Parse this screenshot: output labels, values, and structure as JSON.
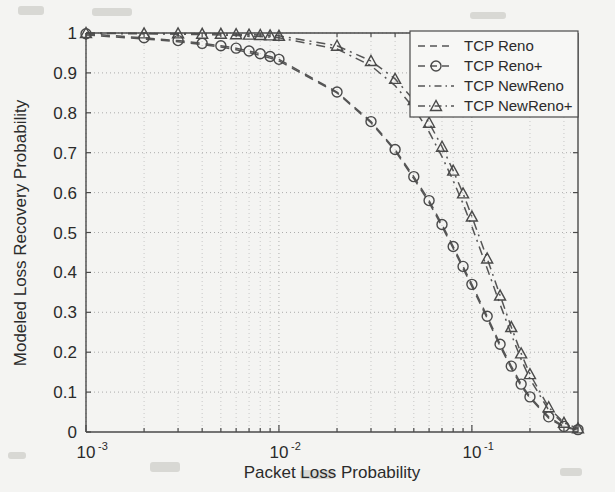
{
  "chart_data": {
    "type": "line",
    "title": "",
    "xlabel": "Packet Loss Probability",
    "ylabel": "Modeled Loss Recovery Probability",
    "xscale": "log",
    "yscale": "linear",
    "xlim": [
      0.001,
      0.3548
    ],
    "ylim": [
      0,
      1
    ],
    "grid": true,
    "legend_position": "top-right",
    "x_tick_labels": [
      "10^-3",
      "10^-2",
      "10^-1"
    ],
    "x_tick_values": [
      0.001,
      0.01,
      0.1
    ],
    "y_tick_labels": [
      "0",
      "0.1",
      "0.2",
      "0.3",
      "0.4",
      "0.5",
      "0.6",
      "0.7",
      "0.8",
      "0.9",
      "1"
    ],
    "y_tick_values": [
      0,
      0.1,
      0.2,
      0.3,
      0.4,
      0.5,
      0.6,
      0.7,
      0.8,
      0.9,
      1.0
    ],
    "series": [
      {
        "name": "TCP Reno",
        "linestyle": "dashed",
        "marker": "none",
        "color": "#555555",
        "x": [
          0.001,
          0.002,
          0.003,
          0.004,
          0.005,
          0.006,
          0.007,
          0.008,
          0.009,
          0.01,
          0.02,
          0.03,
          0.04,
          0.05,
          0.06,
          0.07,
          0.08,
          0.09,
          0.1,
          0.12,
          0.14,
          0.16,
          0.18,
          0.2,
          0.25,
          0.3,
          0.3548
        ],
        "y": [
          0.995,
          0.985,
          0.978,
          0.971,
          0.965,
          0.958,
          0.951,
          0.944,
          0.937,
          0.93,
          0.85,
          0.775,
          0.705,
          0.635,
          0.575,
          0.515,
          0.46,
          0.41,
          0.365,
          0.285,
          0.215,
          0.16,
          0.115,
          0.085,
          0.035,
          0.012,
          0.005
        ]
      },
      {
        "name": "TCP Reno+",
        "linestyle": "dashed",
        "marker": "circle",
        "color": "#555555",
        "x": [
          0.001,
          0.002,
          0.003,
          0.004,
          0.005,
          0.006,
          0.007,
          0.008,
          0.009,
          0.01,
          0.02,
          0.03,
          0.04,
          0.05,
          0.06,
          0.07,
          0.08,
          0.09,
          0.1,
          0.12,
          0.14,
          0.16,
          0.18,
          0.2,
          0.25,
          0.3,
          0.3548
        ],
        "y": [
          0.998,
          0.988,
          0.981,
          0.974,
          0.968,
          0.962,
          0.955,
          0.948,
          0.941,
          0.934,
          0.852,
          0.778,
          0.708,
          0.64,
          0.58,
          0.52,
          0.465,
          0.415,
          0.37,
          0.29,
          0.22,
          0.165,
          0.12,
          0.088,
          0.038,
          0.014,
          0.006
        ]
      },
      {
        "name": "TCP NewReno",
        "linestyle": "dashdot",
        "marker": "none",
        "color": "#555555",
        "x": [
          0.001,
          0.002,
          0.003,
          0.004,
          0.005,
          0.006,
          0.007,
          0.008,
          0.009,
          0.01,
          0.02,
          0.03,
          0.04,
          0.05,
          0.06,
          0.07,
          0.08,
          0.09,
          0.1,
          0.12,
          0.14,
          0.16,
          0.18,
          0.2,
          0.25,
          0.3,
          0.3548
        ],
        "y": [
          0.999,
          0.998,
          0.997,
          0.996,
          0.995,
          0.994,
          0.992,
          0.991,
          0.99,
          0.988,
          0.96,
          0.918,
          0.868,
          0.812,
          0.752,
          0.69,
          0.63,
          0.572,
          0.515,
          0.41,
          0.32,
          0.245,
          0.182,
          0.133,
          0.055,
          0.02,
          0.008
        ]
      },
      {
        "name": "TCP NewReno+",
        "linestyle": "dashdot",
        "marker": "triangle",
        "color": "#555555",
        "x": [
          0.001,
          0.002,
          0.003,
          0.004,
          0.005,
          0.006,
          0.007,
          0.008,
          0.009,
          0.01,
          0.02,
          0.03,
          0.04,
          0.05,
          0.06,
          0.07,
          0.08,
          0.09,
          0.1,
          0.12,
          0.14,
          0.16,
          0.18,
          0.2,
          0.25,
          0.3,
          0.3548
        ],
        "y": [
          1.0,
          0.999,
          0.999,
          0.998,
          0.998,
          0.997,
          0.996,
          0.995,
          0.994,
          0.993,
          0.968,
          0.93,
          0.885,
          0.832,
          0.775,
          0.715,
          0.655,
          0.598,
          0.54,
          0.435,
          0.342,
          0.263,
          0.197,
          0.145,
          0.062,
          0.023,
          0.009
        ]
      }
    ]
  },
  "legend": {
    "items": [
      {
        "label": "TCP Reno",
        "style": "dashed",
        "marker": "none"
      },
      {
        "label": "TCP Reno+",
        "style": "dashed",
        "marker": "circle"
      },
      {
        "label": "TCP NewReno",
        "style": "dashdot",
        "marker": "none"
      },
      {
        "label": "TCP NewReno+",
        "style": "dashdot",
        "marker": "triangle"
      }
    ]
  },
  "axes": {
    "x_title": "Packet Loss Probability",
    "y_title": "Modeled Loss Recovery Probability",
    "x_ticks": [
      {
        "mantissa": "10",
        "exponent": "-3"
      },
      {
        "mantissa": "10",
        "exponent": "-2"
      },
      {
        "mantissa": "10",
        "exponent": "-1"
      }
    ],
    "y_ticks": [
      "1",
      "0.9",
      "0.8",
      "0.7",
      "0.6",
      "0.5",
      "0.4",
      "0.3",
      "0.2",
      "0.1",
      "0"
    ]
  }
}
